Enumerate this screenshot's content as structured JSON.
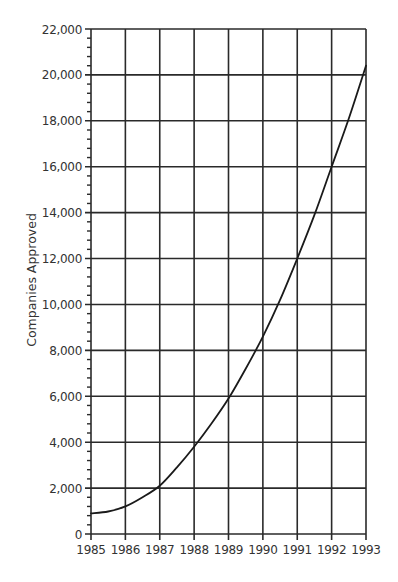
{
  "chart_data": {
    "type": "line",
    "title": "",
    "xlabel": "",
    "ylabel": "Companies Approved",
    "x": [
      1985,
      1986,
      1987,
      1988,
      1989,
      1990,
      1991,
      1992,
      1993
    ],
    "x_tick_labels": [
      "1985",
      "1986",
      "1987",
      "1988",
      "1989",
      "1990",
      "1991",
      "1992",
      "1993"
    ],
    "y_tick_labels": [
      "0",
      "2,000",
      "4,000",
      "6,000",
      "8,000",
      "10,000",
      "12,000",
      "14,000",
      "16,000",
      "18,000",
      "20,000",
      "22,000"
    ],
    "y_ticks": [
      0,
      2000,
      4000,
      6000,
      8000,
      10000,
      12000,
      14000,
      16000,
      18000,
      20000,
      22000
    ],
    "xlim": [
      1985,
      1993
    ],
    "ylim": [
      0,
      22000
    ],
    "grid": true,
    "minor_ticks_per_major": 4,
    "legend": null,
    "series": [
      {
        "name": "Companies Approved",
        "values": [
          900,
          1200,
          2100,
          3800,
          5900,
          8600,
          12000,
          16000,
          20400
        ]
      }
    ],
    "curve_detail": [
      [
        1985.0,
        900
      ],
      [
        1985.5,
        980
      ],
      [
        1986.0,
        1200
      ],
      [
        1986.5,
        1600
      ],
      [
        1987.0,
        2100
      ],
      [
        1987.5,
        2900
      ],
      [
        1988.0,
        3800
      ],
      [
        1988.5,
        4800
      ],
      [
        1989.0,
        5900
      ],
      [
        1989.5,
        7200
      ],
      [
        1990.0,
        8600
      ],
      [
        1990.5,
        10200
      ],
      [
        1991.0,
        12000
      ],
      [
        1991.5,
        13900
      ],
      [
        1992.0,
        16000
      ],
      [
        1992.5,
        18100
      ],
      [
        1993.0,
        20400
      ]
    ],
    "colors": {
      "line": "#1a1a1a",
      "grid": "#2a2a2a",
      "text": "#333333",
      "background": "#ffffff"
    }
  }
}
